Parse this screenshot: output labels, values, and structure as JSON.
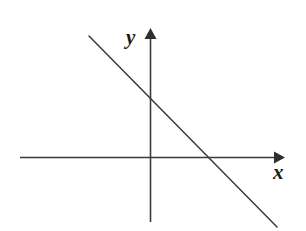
{
  "figure": {
    "background_color": "#ffffff",
    "stroke_color": "#3a3a3a",
    "label_color": "#1a1a1a",
    "width": 306,
    "height": 231
  },
  "axes": {
    "x_axis": {
      "label": "x",
      "icon": "arrow-right-icon",
      "start_px": [
        20,
        157
      ],
      "end_px": [
        285,
        157
      ],
      "arrow_at": "end"
    },
    "y_axis": {
      "label": "y",
      "icon": "arrow-up-icon",
      "start_px": [
        150,
        222
      ],
      "end_px": [
        150,
        28
      ],
      "arrow_at": "end"
    },
    "origin_px": [
      150,
      157
    ]
  },
  "chart_data": {
    "type": "line",
    "title": "",
    "subtitle": "",
    "xlabel": "x",
    "ylabel": "y",
    "grid": false,
    "legend": null,
    "axis_style": "arrowed-cartesian",
    "xlim": [
      -6.5,
      5.6
    ],
    "ylim": [
      -3.2,
      4.2
    ],
    "series": [
      {
        "name": "line",
        "kind": "straight-line",
        "slope": -1,
        "intercept": 1.3,
        "x": [
          -2.6,
          2.7
        ],
        "y": [
          3.9,
          -1.5
        ],
        "endpoints_px": [
          [
            89,
            36
          ],
          [
            277,
            227
          ]
        ],
        "x_intercept": 1.3,
        "y_intercept": 1.3,
        "x_intercept_px": [
          206,
          157
        ],
        "y_intercept_px": [
          150,
          96
        ],
        "color": "#3a3a3a"
      }
    ],
    "annotations": []
  }
}
